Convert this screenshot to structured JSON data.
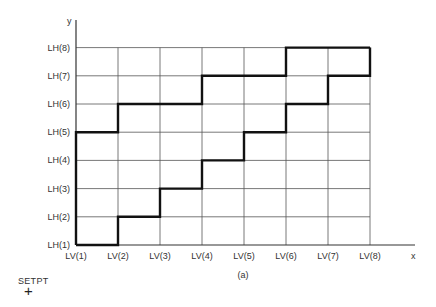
{
  "figure": {
    "caption": "(a)",
    "x_axis_label": "x",
    "y_axis_label": "y",
    "x_ticks": [
      "LV(1)",
      "LV(2)",
      "LV(3)",
      "LV(4)",
      "LV(5)",
      "LV(6)",
      "LV(7)",
      "LV(8)"
    ],
    "y_ticks": [
      "LH(1)",
      "LH(2)",
      "LH(3)",
      "LH(4)",
      "LH(5)",
      "LH(6)",
      "LH(7)",
      "LH(8)"
    ],
    "lower_staircase": [
      [
        1,
        1
      ],
      [
        2,
        1
      ],
      [
        2,
        2
      ],
      [
        3,
        2
      ],
      [
        3,
        3
      ],
      [
        4,
        3
      ],
      [
        4,
        4
      ],
      [
        5,
        4
      ],
      [
        5,
        5
      ],
      [
        6,
        5
      ],
      [
        6,
        6
      ],
      [
        7,
        6
      ],
      [
        7,
        7
      ],
      [
        8,
        7
      ],
      [
        8,
        8
      ]
    ],
    "upper_staircase": [
      [
        1,
        1
      ],
      [
        1,
        5
      ],
      [
        2,
        5
      ],
      [
        2,
        6
      ],
      [
        4,
        6
      ],
      [
        4,
        7
      ],
      [
        6,
        7
      ],
      [
        6,
        8
      ],
      [
        8,
        8
      ]
    ],
    "marker_label": "SETPT",
    "marker_symbol": "+"
  }
}
